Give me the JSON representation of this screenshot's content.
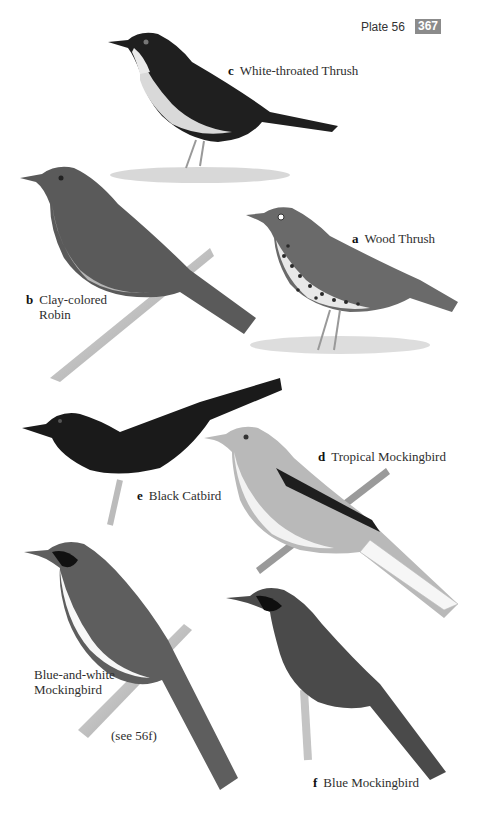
{
  "header": {
    "plate_label": "Plate 56",
    "page_number": "367"
  },
  "species": [
    {
      "letter": "a",
      "name": "Wood Thrush"
    },
    {
      "letter": "b",
      "name_line1": "Clay-colored",
      "name_line2": "Robin"
    },
    {
      "letter": "c",
      "name": "White-throated Thrush"
    },
    {
      "letter": "d",
      "name": "Tropical Mockingbird"
    },
    {
      "letter": "e",
      "name": "Black Catbird"
    },
    {
      "letter": "f",
      "name": "Blue Mockingbird"
    }
  ],
  "extra": {
    "name_line1": "Blue-and-white",
    "name_line2": "Mockingbird",
    "cross_reference": "(see 56f)"
  },
  "colors": {
    "page_number_badge": "#8b8b8b",
    "text": "#2e2e2e"
  }
}
